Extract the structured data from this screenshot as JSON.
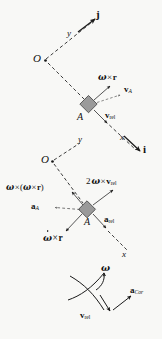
{
  "figure": {
    "kind": "vector-kinematics-diagram",
    "background_color": "#f8f8f6",
    "ink_color": "#1a1a1a",
    "block_fill_color": "#9a9a9a",
    "block_stroke_color": "#4d4d4d",
    "panels": [
      {
        "id": "velocity-panel",
        "caption": "rotating frame velocity decomposition at point A"
      },
      {
        "id": "acceleration-panel",
        "caption": "rotating frame acceleration decomposition at point A"
      },
      {
        "id": "coriolis-panel",
        "caption": "Coriolis acceleration sense construction"
      }
    ]
  },
  "velocity_panel": {
    "origin_label": "O",
    "axis_y_label": "y",
    "axis_x_label": "x",
    "unit_vector_j": "j",
    "unit_vector_i": "i",
    "block_label": "A",
    "vectors": [
      {
        "name": "omega-cross-r",
        "omega": "ω",
        "times": "×",
        "r": "r"
      },
      {
        "name": "v-A",
        "symbol": "v",
        "subscript": "A"
      },
      {
        "name": "v-rel",
        "symbol": "v",
        "subscript": "rel"
      }
    ],
    "label_omega_cross_r_omega": "ω",
    "label_omega_cross_r_times": "×",
    "label_omega_cross_r_r": "r",
    "label_vA_sym": "v",
    "label_vA_sub": "A",
    "label_vrel_sym": "v",
    "label_vrel_sub": "rel"
  },
  "acceleration_panel": {
    "origin_label": "O",
    "axis_y_label": "y",
    "axis_x_label": "x",
    "block_label": "A",
    "label_centripetal_omega": "ω",
    "label_centripetal_times": "×",
    "label_centripetal_open": "(",
    "label_centripetal_close": ")",
    "label_centripetal_r": "r",
    "label_aA_sym": "a",
    "label_aA_sub": "A",
    "label_coriolis_coeff": "2",
    "label_coriolis_omega": "ω",
    "label_coriolis_times": "×",
    "label_coriolis_v": "v",
    "label_coriolis_sub": "rel",
    "label_arel_sym": "a",
    "label_arel_sub": "rel",
    "label_alpha_omega": "ω",
    "label_alpha_times": "×",
    "label_alpha_r": "r"
  },
  "coriolis_panel": {
    "label_omega": "ω",
    "label_vrel_sym": "v",
    "label_vrel_sub": "rel",
    "label_aCor_sym": "a",
    "label_aCor_sub": "Cor"
  }
}
